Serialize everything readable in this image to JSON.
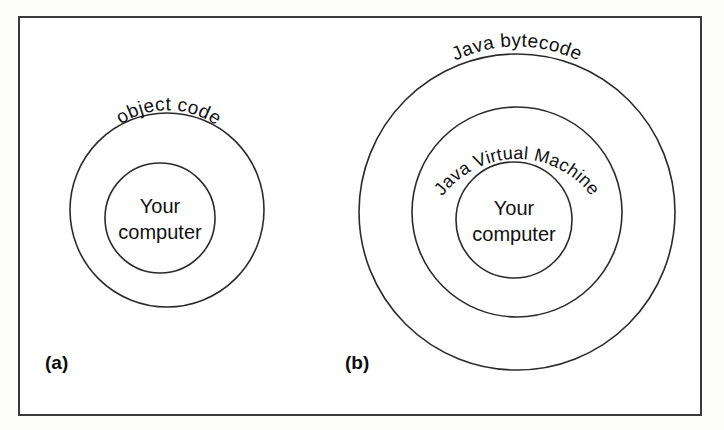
{
  "figure": {
    "background_color": "#ffffff",
    "frame_color": "#3a3a3a",
    "circle_stroke_color": "#2b2b2b",
    "text_color": "#111111"
  },
  "panel_a": {
    "caption": "(a)",
    "outer_ring_label": "object code",
    "center_label_line1": "Your",
    "center_label_line2": "computer",
    "circles": [
      {
        "name": "object-code-ring",
        "cx": 167,
        "cy": 210,
        "r": 97
      },
      {
        "name": "your-computer-circle",
        "cx": 160,
        "cy": 218,
        "r": 55
      }
    ]
  },
  "panel_b": {
    "caption": "(b)",
    "outer_ring_label": "Java bytecode",
    "middle_ring_label": "Java Virtual Machine",
    "center_label_line1": "Your",
    "center_label_line2": "computer",
    "circles": [
      {
        "name": "java-bytecode-ring",
        "cx": 517,
        "cy": 212,
        "r": 158
      },
      {
        "name": "java-virtual-machine-ring",
        "cx": 517,
        "cy": 212,
        "r": 105
      },
      {
        "name": "your-computer-circle",
        "cx": 514,
        "cy": 220,
        "r": 58
      }
    ]
  }
}
